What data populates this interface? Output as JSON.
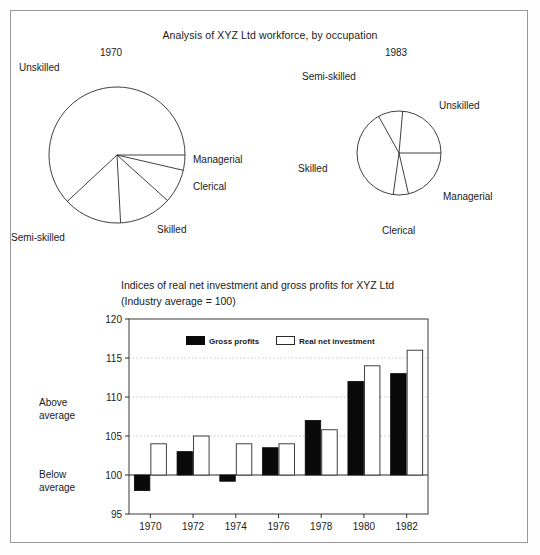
{
  "page": {
    "background": "#ffffff",
    "border_color": "#9a9a9a"
  },
  "pies": {
    "title": "Analysis of XYZ Ltd workforce, by occupation",
    "left": {
      "year_label": "1970",
      "labels": {
        "unskilled": "Unskilled",
        "semi_skilled": "Semi-skilled",
        "skilled": "Skilled",
        "clerical": "Clerical",
        "managerial": "Managerial"
      }
    },
    "right": {
      "year_label": "1983",
      "labels": {
        "semi_skilled": "Semi-skilled",
        "unskilled": "Unskilled",
        "skilled": "Skilled",
        "managerial": "Managerial",
        "clerical": "Clerical"
      }
    }
  },
  "bar_chart": {
    "title_line1": "Indices of real net investment and gross profits for XYZ Ltd",
    "title_line2": "(Industry average = 100)",
    "side_label_above_1": "Above",
    "side_label_above_2": "average",
    "side_label_below_1": "Below",
    "side_label_below_2": "average",
    "legend": {
      "series1": "Gross profits",
      "series2": "Real net investment"
    }
  },
  "chart_data": [
    {
      "type": "pie",
      "title": "Analysis of XYZ Ltd workforce, by occupation",
      "subtitle": "1970",
      "labels": [
        "Managerial",
        "Clerical",
        "Skilled",
        "Semi-skilled",
        "Unskilled"
      ],
      "values": [
        3.6,
        8.1,
        12.5,
        13.9,
        61.9
      ],
      "unit": "percent of workforce",
      "start_angle_deg": 0,
      "direction": "clockwise"
    },
    {
      "type": "pie",
      "title": "Analysis of XYZ Ltd workforce, by occupation",
      "subtitle": "1983",
      "labels": [
        "Unskilled",
        "Managerial",
        "Clerical",
        "Skilled",
        "Semi-skilled"
      ],
      "values": [
        23.6,
        21.7,
        5.6,
        39.7,
        9.4
      ],
      "unit": "percent of workforce",
      "start_angle_deg": 0,
      "direction": "clockwise"
    },
    {
      "type": "bar",
      "title": "Indices of real net investment and gross profits for XYZ Ltd",
      "subtitle": "(Industry average = 100)",
      "categories": [
        "1970",
        "1972",
        "1974",
        "1976",
        "1978",
        "1980",
        "1982"
      ],
      "series": [
        {
          "name": "Gross profits",
          "color": "#0a0a0a",
          "values": [
            98,
            103,
            99.2,
            103.5,
            107,
            112,
            113
          ]
        },
        {
          "name": "Real net investment",
          "color": "#ffffff",
          "values": [
            104,
            105,
            104,
            104,
            105.8,
            114,
            116
          ]
        }
      ],
      "xlabel": "",
      "ylabel": "",
      "ylim": [
        95,
        120
      ],
      "yticks": [
        95,
        100,
        105,
        110,
        115,
        120
      ],
      "baseline": 100,
      "grid": true,
      "grid_style": "dotted-horizontal",
      "legend_position": "top-center"
    }
  ]
}
